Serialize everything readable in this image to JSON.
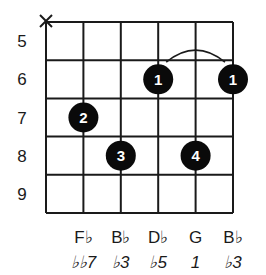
{
  "diagram": {
    "type": "guitar-chord-diagram",
    "strings": 6,
    "muted_strings": [
      0
    ],
    "muted_symbol": "X",
    "fret_numbers": [
      "5",
      "6",
      "7",
      "8",
      "9"
    ],
    "barre": {
      "fret_index": 1,
      "from_string": 3,
      "to_string": 5
    },
    "dots": [
      {
        "string": 1,
        "fret_index": 2,
        "finger": "2"
      },
      {
        "string": 2,
        "fret_index": 3,
        "finger": "3"
      },
      {
        "string": 3,
        "fret_index": 1,
        "finger": "1"
      },
      {
        "string": 4,
        "fret_index": 3,
        "finger": "4"
      },
      {
        "string": 5,
        "fret_index": 1,
        "finger": "1"
      }
    ],
    "notes": [
      {
        "string": 1,
        "name": "F♭",
        "interval": "♭♭7"
      },
      {
        "string": 2,
        "name": "B♭",
        "interval": "♭3"
      },
      {
        "string": 3,
        "name": "D♭",
        "interval": "♭5"
      },
      {
        "string": 4,
        "name": "G",
        "interval": "1"
      },
      {
        "string": 5,
        "name": "B♭",
        "interval": "♭3"
      }
    ],
    "colors": {
      "line": "#1a1a1a",
      "dot": "#0a0a0a",
      "dot_text": "#ffffff",
      "background": "#ffffff"
    }
  }
}
